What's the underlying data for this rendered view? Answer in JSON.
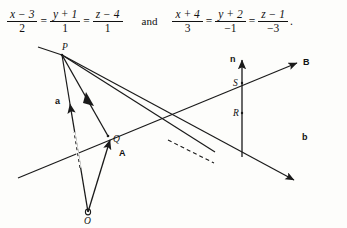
{
  "equations": {
    "line1": {
      "terms": [
        {
          "num_var": "x",
          "num_op": "−",
          "num_const": "3",
          "den": "2"
        },
        {
          "num_var": "y",
          "num_op": "+",
          "num_const": "1",
          "den": "1"
        },
        {
          "num_var": "z",
          "num_op": "−",
          "num_const": "4",
          "den": "1"
        }
      ],
      "equals": "="
    },
    "conjunction": "and",
    "line2": {
      "terms": [
        {
          "num_var": "x",
          "num_op": "+",
          "num_const": "4",
          "den": "3"
        },
        {
          "num_var": "y",
          "num_op": "+",
          "num_const": "2",
          "den": "−1"
        },
        {
          "num_var": "z",
          "num_op": "−",
          "num_const": "1",
          "den": "−3"
        }
      ],
      "equals": "=",
      "trailing_punctuation": "."
    }
  },
  "diagram": {
    "type": "vector-geometry-two-skew-lines",
    "point_labels": [
      {
        "id": "P",
        "text": "P",
        "x": 62,
        "y": 9
      },
      {
        "id": "Q",
        "text": "Q",
        "x": 113,
        "y": 99
      },
      {
        "id": "O",
        "text": "O",
        "x": 84,
        "y": 170
      },
      {
        "id": "S",
        "text": "S",
        "x": 234,
        "y": 44
      },
      {
        "id": "R",
        "text": "R",
        "x": 234,
        "y": 69
      }
    ],
    "vector_labels": [
      {
        "id": "a",
        "text": "a",
        "x": 55,
        "y": 60
      },
      {
        "id": "A",
        "text": "A",
        "x": 120,
        "y": 113
      },
      {
        "id": "n",
        "text": "n",
        "x": 230,
        "y": 13
      },
      {
        "id": "B",
        "text": "B",
        "x": 305,
        "y": 20
      },
      {
        "id": "b",
        "text": "b",
        "x": 304,
        "y": 96
      }
    ],
    "stroke_color": "#1a1a1a",
    "background_color": "#fdfdfb"
  }
}
